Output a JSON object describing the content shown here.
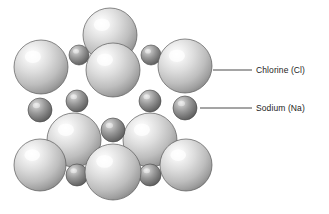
{
  "diagram": {
    "background_color": "#ffffff",
    "width": 329,
    "height": 214
  },
  "labels": [
    {
      "id": "chlorine",
      "text": "Chlorine (Cl)",
      "element_symbol": "Cl",
      "element_name": "Chlorine",
      "text_x": 256,
      "text_y": 70,
      "leader_line": {
        "x1": 213,
        "y1": 70,
        "x2": 252,
        "y2": 70
      },
      "color": "#1c1c1c"
    },
    {
      "id": "sodium",
      "text": "Sodium (Na)",
      "element_symbol": "Na",
      "element_name": "Sodium",
      "text_x": 256,
      "text_y": 108,
      "leader_line": {
        "x1": 200,
        "y1": 108,
        "x2": 252,
        "y2": 108
      },
      "color": "#1c1c1c"
    }
  ],
  "atoms": {
    "chlorine": {
      "label": "Chlorine (Cl)",
      "radius": 25,
      "fill_light": "#f2f2f2",
      "fill_mid": "#c8c8c8",
      "fill_dark": "#8c8c8c",
      "stroke": "#5a5a5a"
    },
    "sodium": {
      "label": "Sodium (Na)",
      "radius": 11,
      "fill_light": "#cfcfcf",
      "fill_mid": "#9a9a9a",
      "fill_dark": "#5d5d5d",
      "stroke": "#434343"
    }
  },
  "lattice_spheres": [
    {
      "kind": "sodium",
      "cx": 77,
      "cy": 101,
      "r": 11,
      "z": 1
    },
    {
      "kind": "sodium",
      "cx": 151,
      "cy": 55,
      "r": 10,
      "z": 1
    },
    {
      "kind": "sodium",
      "cx": 79,
      "cy": 55,
      "r": 10,
      "z": 1
    },
    {
      "kind": "chlorine",
      "cx": 41,
      "cy": 67,
      "r": 27,
      "z": 2
    },
    {
      "kind": "chlorine",
      "cx": 110,
      "cy": 35,
      "r": 27,
      "z": 2
    },
    {
      "kind": "chlorine",
      "cx": 185,
      "cy": 66,
      "r": 27,
      "z": 2
    },
    {
      "kind": "sodium",
      "cx": 150,
      "cy": 101,
      "r": 11,
      "z": 3
    },
    {
      "kind": "sodium",
      "cx": 185,
      "cy": 108,
      "r": 12,
      "z": 3
    },
    {
      "kind": "sodium",
      "cx": 40,
      "cy": 110,
      "r": 12,
      "z": 3
    },
    {
      "kind": "chlorine",
      "cx": 113,
      "cy": 70,
      "r": 27,
      "z": 4
    },
    {
      "kind": "chlorine",
      "cx": 74,
      "cy": 140,
      "r": 27,
      "z": 5
    },
    {
      "kind": "chlorine",
      "cx": 150,
      "cy": 140,
      "r": 27,
      "z": 5
    },
    {
      "kind": "sodium",
      "cx": 113,
      "cy": 130,
      "r": 12,
      "z": 6
    },
    {
      "kind": "sodium",
      "cx": 77,
      "cy": 175,
      "r": 11,
      "z": 6
    },
    {
      "kind": "sodium",
      "cx": 150,
      "cy": 175,
      "r": 11,
      "z": 6
    },
    {
      "kind": "chlorine",
      "cx": 40,
      "cy": 165,
      "r": 26,
      "z": 7
    },
    {
      "kind": "chlorine",
      "cx": 186,
      "cy": 165,
      "r": 26,
      "z": 7
    },
    {
      "kind": "chlorine",
      "cx": 113,
      "cy": 172,
      "r": 28,
      "z": 8
    }
  ]
}
